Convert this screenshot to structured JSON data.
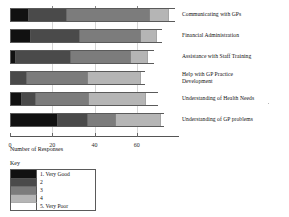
{
  "chart_data": {
    "type": "bar",
    "orientation": "horizontal",
    "stacked": true,
    "title": "",
    "xlabel": "Number of Responses",
    "ylabel": "",
    "grid": true,
    "legend_position": "bottom-left",
    "xlim": [
      0,
      80
    ],
    "xticks": [
      0,
      20,
      40,
      60
    ],
    "xticklabels": [
      "0",
      "20",
      "40",
      "60"
    ],
    "categories": [
      "Communicating with GPs",
      "Financial Administration",
      "Assistance with Staff Training",
      "Help with GP Practice\nDevelopment",
      "Understanding of Health Needs",
      "Understanding of GP problems"
    ],
    "series": [
      {
        "name": "1. Very Good",
        "color": "#111111",
        "values": [
          8,
          9,
          2,
          0,
          5,
          22
        ]
      },
      {
        "name": "2",
        "color": "#4a4a4a",
        "values": [
          18,
          23,
          26,
          7,
          6,
          14
        ]
      },
      {
        "name": "3",
        "color": "#7c7c7c",
        "values": [
          39,
          29,
          28,
          29,
          25,
          13
        ]
      },
      {
        "name": "4",
        "color": "#b5b5b5",
        "values": [
          9,
          7,
          8,
          25,
          27,
          21
        ]
      },
      {
        "name": "5. Very Poor",
        "color": "#ffffff",
        "values": [
          4,
          4,
          4,
          3,
          7,
          3
        ]
      }
    ]
  },
  "legend": {
    "title": "Key",
    "entries": [
      {
        "label": "1. Very Good",
        "color": "#111111"
      },
      {
        "label": "2",
        "color": "#4a4a4a"
      },
      {
        "label": "3",
        "color": "#7c7c7c"
      },
      {
        "label": "4",
        "color": "#b5b5b5"
      },
      {
        "label": "5. Very Poor",
        "color": "#ffffff"
      }
    ]
  },
  "axis": {
    "x_title": "Number of Responses"
  }
}
